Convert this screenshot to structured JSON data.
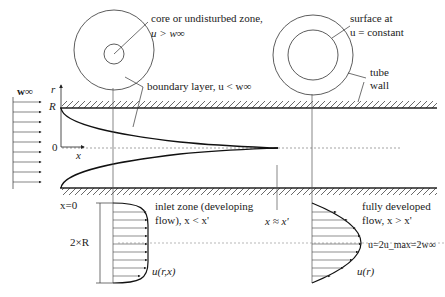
{
  "diagram": {
    "type": "pipe-flow-boundary-layer",
    "colors": {
      "stroke": "#222222",
      "background": "#ffffff",
      "hatch": "#444444"
    },
    "labels": {
      "core_zone_line1": "core or undisturbed zone,",
      "core_zone_line2": "u > w∞",
      "surface_line1": "surface at",
      "surface_line2": "u = constant",
      "boundary_layer": "boundary layer, u < w∞",
      "tube_wall_line1": "tube",
      "tube_wall_line2": "wall",
      "w_inf": "w∞",
      "axis_r": "r",
      "axis_R": "R",
      "axis_zero": "0",
      "axis_x": "x",
      "x_zero": "x=0",
      "two_R": "2×R",
      "inlet_line1": "inlet zone (developing",
      "inlet_line2": "flow), x < x'",
      "x_approx": "x ≈ x'",
      "developed_line1": "fully developed",
      "developed_line2": "flow, x > x'",
      "u_max": "u=2u_max=2w∞",
      "u_rx": "u(r,x)",
      "u_r": "u(r)"
    }
  }
}
